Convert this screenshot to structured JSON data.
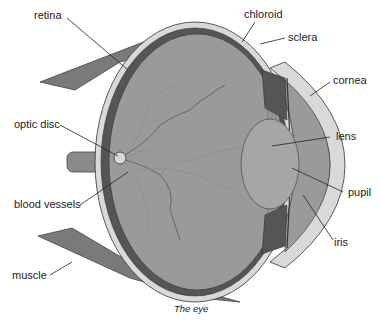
{
  "diagram": {
    "caption": "The eye",
    "labels": {
      "retina": "retina",
      "chloroid": "chloroid",
      "sclera": "sclera",
      "cornea": "cornea",
      "optic_disc": "optic disc",
      "lens": "lens",
      "blood_vessels": "blood vessels",
      "pupil": "pupil",
      "iris": "iris",
      "muscle": "muscle"
    },
    "colors": {
      "muscle": "#7a7a7a",
      "sclera": "#d9d9d9",
      "chloroid": "#555555",
      "interior": "#9a9a9a",
      "lens": "#a6a6a6",
      "outline": "#333333"
    }
  }
}
